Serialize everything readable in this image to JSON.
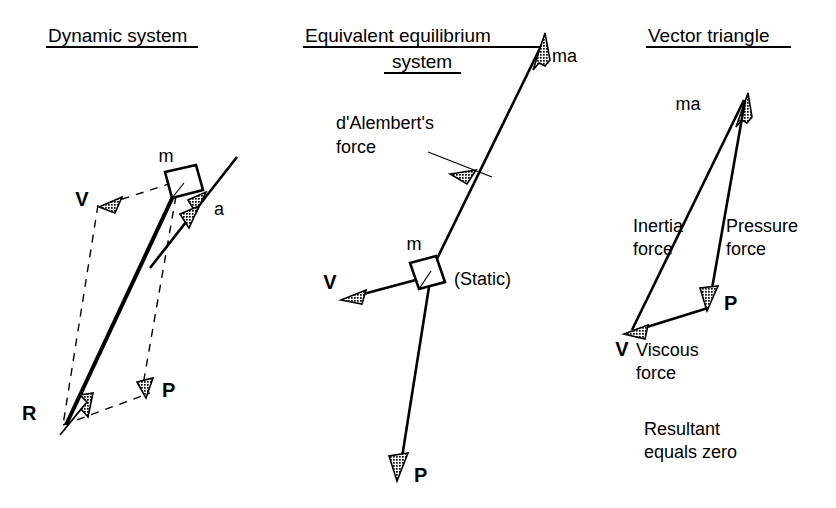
{
  "figure": {
    "background_color": "#ffffff",
    "ink_color": "#000000",
    "width": 836,
    "height": 508
  },
  "panels": {
    "left": {
      "title": "Dynamic system",
      "labels": {
        "mass": "m",
        "velocity": "V",
        "acceleration": "a",
        "pressure": "P",
        "resultant": "R"
      }
    },
    "middle": {
      "title_line1": "Equivalent equilibrium",
      "title_line2": "system",
      "labels": {
        "dalembert_line1": "d'Alembert's",
        "dalembert_line2": "force",
        "inertia_force": "ma",
        "mass": "m",
        "static": "(Static)",
        "velocity": "V",
        "pressure": "P"
      }
    },
    "right": {
      "title": "Vector triangle",
      "labels": {
        "ma": "ma",
        "inertia_line1": "Inertia",
        "inertia_line2": "force",
        "pressure_line1": "Pressure",
        "pressure_line2": "force",
        "viscous_vertex": "V",
        "viscous_line1": "Viscous",
        "viscous_line2": "force",
        "pressure_vertex": "P",
        "note_line1": "Resultant",
        "note_line2": "equals zero"
      }
    }
  }
}
